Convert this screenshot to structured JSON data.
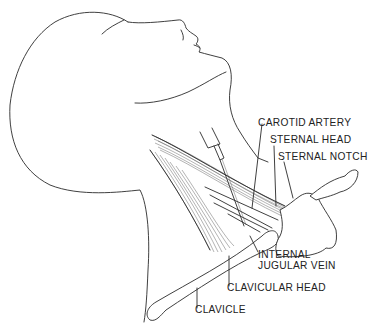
{
  "figure": {
    "labels": {
      "carotid_artery": "CAROTID ARTERY",
      "sternal_head": "STERNAL HEAD",
      "sternal_notch": "STERNAL NOTCH",
      "internal_jugular_vein_line1": "INTERNAL",
      "internal_jugular_vein_line2": "JUGULAR VEIN",
      "clavicular_head": "CLAVICULAR HEAD",
      "clavicle": "CLAVICLE"
    },
    "colors": {
      "background": "#ffffff",
      "ink": "#2a2a2a"
    }
  }
}
